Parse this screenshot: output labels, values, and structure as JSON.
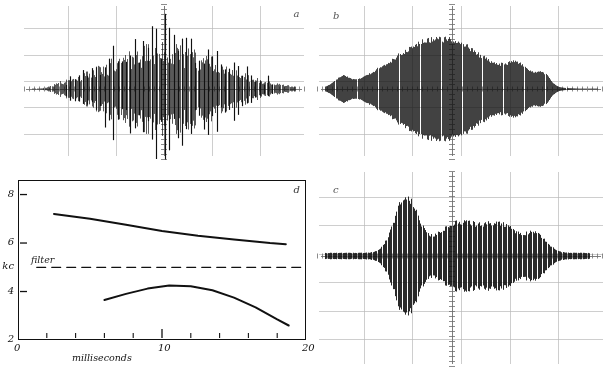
{
  "figure": {
    "background": "#ffffff",
    "ink": "#111111",
    "caption": ""
  },
  "panels": [
    {
      "id": "a",
      "label": "a",
      "kind": "oscilloscope-trace",
      "description": "dense amplitude-modulated waveform with spiky irregular envelope"
    },
    {
      "id": "b",
      "label": "b",
      "kind": "oscilloscope-trace",
      "description": "dense high frequency waveform with broad smooth lobed envelope"
    },
    {
      "id": "c",
      "label": "c",
      "kind": "oscilloscope-trace",
      "description": "lower amplitude waveform with early peak and long decaying tail"
    },
    {
      "id": "d",
      "label": "d",
      "kind": "line-chart"
    }
  ],
  "chart_data": {
    "type": "line",
    "title": "",
    "xlabel": "milliseconds",
    "ylabel": "kc",
    "xlim": [
      0,
      20
    ],
    "ylim": [
      2,
      8.6
    ],
    "grid": false,
    "x_ticks_major": [
      0,
      10,
      20
    ],
    "x_tick_labels": [
      "0",
      "10",
      "20"
    ],
    "x_ticks_minor": [
      2,
      4,
      6,
      8,
      12,
      14,
      16,
      18
    ],
    "y_ticks": [
      2,
      4,
      6,
      8
    ],
    "y_tick_labels": [
      "2",
      "4",
      "6",
      "8"
    ],
    "y_axis_unit_label": "kc",
    "annotations": [
      {
        "text": "filter",
        "x": 2.0,
        "y": 5.0
      }
    ],
    "series": [
      {
        "name": "upper formant",
        "style": "solid",
        "points": [
          [
            2.5,
            7.2
          ],
          [
            5.0,
            7.0
          ],
          [
            7.5,
            6.75
          ],
          [
            10.0,
            6.5
          ],
          [
            12.5,
            6.3
          ],
          [
            15.0,
            6.15
          ],
          [
            17.5,
            6.0
          ],
          [
            18.6,
            5.95
          ]
        ]
      },
      {
        "name": "filter",
        "style": "dashed",
        "points": [
          [
            1.3,
            5.0
          ],
          [
            20.0,
            5.0
          ]
        ]
      },
      {
        "name": "lower formant",
        "style": "solid",
        "points": [
          [
            6.0,
            3.65
          ],
          [
            7.5,
            3.9
          ],
          [
            9.0,
            4.12
          ],
          [
            10.5,
            4.25
          ],
          [
            12.0,
            4.22
          ],
          [
            13.5,
            4.05
          ],
          [
            15.0,
            3.75
          ],
          [
            16.5,
            3.35
          ],
          [
            18.0,
            2.85
          ],
          [
            18.8,
            2.6
          ]
        ]
      }
    ]
  },
  "scope_graticules": {
    "major_line_color": "#b9b9b9",
    "center_axis_color": "#6f6f6f",
    "trace_color": "#111111"
  }
}
